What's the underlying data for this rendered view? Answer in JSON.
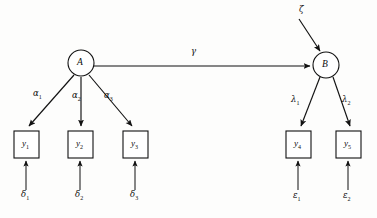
{
  "figure": {
    "type": "path-diagram",
    "background_color": "#fdfdfc",
    "line_color": "#111111"
  },
  "latent_nodes": [
    {
      "id": "A",
      "label": "A",
      "cx": 81,
      "cy": 63,
      "r": 13,
      "shape": "circle"
    },
    {
      "id": "B",
      "label": "B",
      "cx": 326,
      "cy": 65,
      "r": 13,
      "shape": "circle"
    }
  ],
  "observed_boxes": [
    {
      "id": "y1",
      "label": "y",
      "subscript": "1",
      "x": 14,
      "y": 131,
      "w": 25,
      "h": 27
    },
    {
      "id": "y2",
      "label": "y",
      "subscript": "2",
      "x": 68,
      "y": 131,
      "w": 25,
      "h": 27
    },
    {
      "id": "y3",
      "label": "y",
      "subscript": "3",
      "x": 123,
      "y": 131,
      "w": 25,
      "h": 27
    },
    {
      "id": "y4",
      "label": "y",
      "subscript": "4",
      "x": 286,
      "y": 131,
      "w": 25,
      "h": 27
    },
    {
      "id": "y5",
      "label": "y",
      "subscript": "5",
      "x": 336,
      "y": 131,
      "w": 25,
      "h": 27
    }
  ],
  "path_labels": [
    {
      "id": "alpha1",
      "symbol": "α",
      "subscript": "1",
      "x": 35,
      "y": 93,
      "from": "A",
      "to": "y1"
    },
    {
      "id": "alpha2",
      "symbol": "α",
      "subscript": "2",
      "x": 74,
      "y": 95,
      "from": "A",
      "to": "y2"
    },
    {
      "id": "alpha3",
      "symbol": "α",
      "subscript": "3",
      "x": 106,
      "y": 95,
      "from": "A",
      "to": "y3"
    },
    {
      "id": "gamma",
      "symbol": "γ",
      "subscript": "",
      "x": 192,
      "y": 51,
      "from": "A",
      "to": "B"
    },
    {
      "id": "lambda1",
      "symbol": "λ",
      "subscript": "1",
      "x": 293,
      "y": 99,
      "from": "B",
      "to": "y4"
    },
    {
      "id": "lambda2",
      "symbol": "λ",
      "subscript": "2",
      "x": 344,
      "y": 99,
      "from": "B",
      "to": "y5"
    }
  ],
  "residual_labels": [
    {
      "id": "delta1",
      "symbol": "δ",
      "subscript": "1",
      "x": 22,
      "y": 194,
      "to": "y1"
    },
    {
      "id": "delta2",
      "symbol": "δ",
      "subscript": "2",
      "x": 76,
      "y": 194,
      "to": "y2"
    },
    {
      "id": "delta3",
      "symbol": "δ",
      "subscript": "3",
      "x": 131,
      "y": 194,
      "to": "y3"
    },
    {
      "id": "epsilon1",
      "symbol": "ε",
      "subscript": "1",
      "x": 294,
      "y": 194,
      "to": "y4"
    },
    {
      "id": "epsilon2",
      "symbol": "ε",
      "subscript": "2",
      "x": 344,
      "y": 194,
      "to": "y5"
    },
    {
      "id": "zeta",
      "symbol": "ζ",
      "subscript": "",
      "x": 301,
      "y": 9,
      "to": "B"
    }
  ],
  "edges": [
    {
      "id": "A-to-y1",
      "from": "A",
      "to": "y1",
      "x1": 74,
      "y1": 75,
      "x2": 29,
      "y2": 127,
      "arrow": true
    },
    {
      "id": "A-to-y2",
      "from": "A",
      "to": "y2",
      "x1": 81,
      "y1": 77,
      "x2": 81,
      "y2": 127,
      "arrow": true
    },
    {
      "id": "A-to-y3",
      "from": "A",
      "to": "y3",
      "x1": 89,
      "y1": 75,
      "x2": 131,
      "y2": 127,
      "arrow": true
    },
    {
      "id": "A-to-B",
      "from": "A",
      "to": "B",
      "x1": 94,
      "y1": 66,
      "x2": 310,
      "y2": 66,
      "arrow": true
    },
    {
      "id": "B-to-y4",
      "from": "B",
      "to": "y4",
      "x1": 320,
      "y1": 77,
      "x2": 301,
      "y2": 127,
      "arrow": true
    },
    {
      "id": "B-to-y5",
      "from": "B",
      "to": "y5",
      "x1": 333,
      "y1": 77,
      "x2": 349,
      "y2": 127,
      "arrow": true
    },
    {
      "id": "zeta-to-B",
      "from": "zeta",
      "to": "B",
      "x1": 300,
      "y1": 20,
      "x2": 321,
      "y2": 51,
      "arrow": true
    },
    {
      "id": "delta1-to-y1",
      "from": "delta1",
      "to": "y1",
      "x1": 26,
      "y1": 189,
      "x2": 26,
      "y2": 161,
      "arrow": true
    },
    {
      "id": "delta2-to-y2",
      "from": "delta2",
      "to": "y2",
      "x1": 80,
      "y1": 189,
      "x2": 80,
      "y2": 161,
      "arrow": true
    },
    {
      "id": "delta3-to-y3",
      "from": "delta3",
      "to": "y3",
      "x1": 135,
      "y1": 189,
      "x2": 135,
      "y2": 161,
      "arrow": true
    },
    {
      "id": "epsilon1-to-y4",
      "from": "epsilon1",
      "to": "y4",
      "x1": 298,
      "y1": 189,
      "x2": 298,
      "y2": 161,
      "arrow": true
    },
    {
      "id": "epsilon2-to-y5",
      "from": "epsilon2",
      "to": "y5",
      "x1": 348,
      "y1": 189,
      "x2": 348,
      "y2": 161,
      "arrow": true
    }
  ]
}
